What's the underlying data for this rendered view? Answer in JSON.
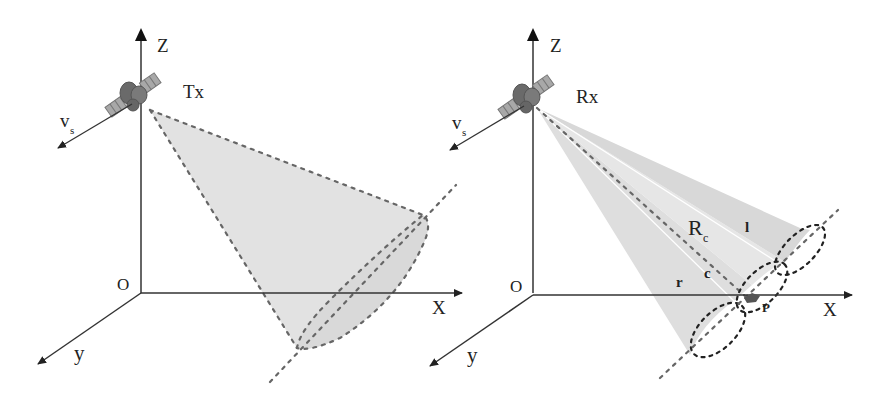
{
  "figure": {
    "left_panel": {
      "title": "Transmitter beam illumination",
      "labels": {
        "z_axis": "Z",
        "x_axis": "X",
        "y_axis": "y",
        "origin": "O",
        "satellite": "Tx",
        "velocity": "v",
        "velocity_sub": "s"
      }
    },
    "right_panel": {
      "title": "Receiver multi-beam reception",
      "labels": {
        "z_axis": "Z",
        "x_axis": "X",
        "y_axis": "y",
        "origin": "O",
        "satellite": "Rx",
        "velocity": "v",
        "velocity_sub": "s",
        "range": "R",
        "range_sub": "c",
        "beam_left": "l",
        "beam_center": "c",
        "beam_right": "r",
        "target_point": "P"
      }
    },
    "colors": {
      "axis": "#333333",
      "dash": "#666666",
      "beam_fill": "#e2e2e2",
      "beam_fill_dark": "#d6d6d6",
      "ellipse_dark": "#222222",
      "satellite": "#6e6e6e"
    }
  }
}
